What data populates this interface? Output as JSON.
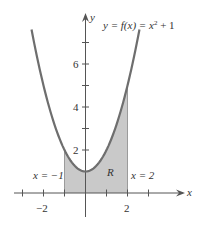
{
  "chart_data": {
    "type": "area",
    "title": "",
    "function_label": "y = f(x) = x² + 1",
    "function_label_parts": {
      "lhs": "y = f(x) = x",
      "exp": "2",
      "rhs": " + 1"
    },
    "xlabel": "x",
    "ylabel": "y",
    "xlim": [
      -3.4,
      4.5
    ],
    "ylim": [
      -1.1,
      8.3
    ],
    "x_ticks": [
      -3,
      -2,
      -1,
      1,
      2,
      3
    ],
    "x_tick_labels": [
      {
        "value": -2,
        "label": "−2"
      },
      {
        "value": 2,
        "label": "2"
      }
    ],
    "y_ticks": [
      1,
      2,
      3,
      4,
      5,
      6,
      7
    ],
    "y_tick_labels": [
      {
        "value": 2,
        "label": "2"
      },
      {
        "value": 4,
        "label": "4"
      },
      {
        "value": 6,
        "label": "6"
      }
    ],
    "curve": {
      "expression": "x^2 + 1",
      "x_range": [
        -2.57,
        2.57
      ]
    },
    "shaded_region": {
      "name": "R",
      "x_from": -1,
      "x_to": 2,
      "between": "curve and x-axis"
    },
    "annotations": [
      {
        "text": "x = −1",
        "near_x": -1
      },
      {
        "text": "x = 2",
        "near_x": 2
      },
      {
        "text": "R",
        "inside_region": true
      }
    ],
    "grid": false,
    "colors": {
      "curve": "#6e6e6e",
      "fill": "#c9c9c9",
      "axis": "#555555"
    }
  },
  "labels": {
    "y_axis": "y",
    "x_axis": "x",
    "fn_lhs": "y = f(x) = x",
    "fn_exp": "2",
    "fn_rhs": " + 1",
    "left_bound": "x = −1",
    "right_bound": "x = 2",
    "region": "R",
    "xt_neg2": "−2",
    "xt_2": "2",
    "yt_2": "2",
    "yt_4": "4",
    "yt_6": "6"
  }
}
